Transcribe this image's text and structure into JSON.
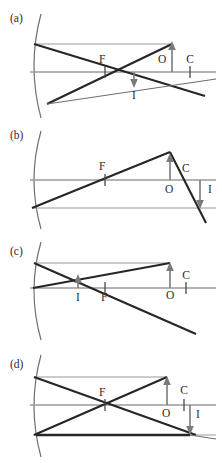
{
  "figure": {
    "type": "optics-ray-diagram-set",
    "width": 222,
    "height": 463,
    "background_color": "#ffffff",
    "ray_color": "#262626",
    "construction_line_color": "#8f8f8f",
    "mirror_color": "#6f6f6f",
    "arrow_color": "#7a7a7a",
    "label_color": "#2b2b2b"
  },
  "panels": [
    {
      "id": "a",
      "letter": "(a)",
      "letter_x": 10,
      "letter_y": 22,
      "axis_y": 72,
      "mirror": {
        "vertex_x": 30,
        "top_x": 40,
        "top_y": 14,
        "bottom_x": 40,
        "bottom_y": 118
      },
      "object": {
        "label": "O",
        "label_x": 158,
        "label_y": 63,
        "base_x": 172,
        "base_y": 72,
        "tip_y": 44,
        "direction": "up"
      },
      "image": {
        "label": "I",
        "label_x": 131,
        "label_y": 96,
        "base_x": 134,
        "base_y": 72,
        "tip_y": 86,
        "direction": "down"
      },
      "focal_point": {
        "label": "F",
        "label_x": 99,
        "label_y": 63,
        "x": 105
      },
      "center_point": {
        "label": "C",
        "label_x": 181,
        "label_y": 63,
        "x": 190
      },
      "notes": "Object beyond C; real inverted reduced image between F and C"
    },
    {
      "id": "b",
      "letter": "(b)",
      "letter_x": 10,
      "letter_y": 139,
      "axis_y": 180,
      "mirror": {
        "vertex_x": 30,
        "top_x": 40,
        "top_y": 131,
        "bottom_x": 40,
        "bottom_y": 228
      },
      "object": {
        "label": "O",
        "label_x": 165,
        "label_y": 192,
        "base_x": 170,
        "base_y": 180,
        "tip_y": 152,
        "direction": "up"
      },
      "image": {
        "label": "I",
        "label_x": 206,
        "label_y": 191,
        "base_x": 200,
        "base_y": 180,
        "tip_y": 208,
        "direction": "down"
      },
      "focal_point": {
        "label": "F",
        "label_x": 99,
        "label_y": 170,
        "x": 105
      },
      "center_point": {
        "label": "C",
        "label_x": 182,
        "label_y": 172,
        "x": 190
      },
      "notes": "Object between F and C; real inverted magnified image beyond C"
    },
    {
      "id": "c",
      "letter": "(c)",
      "letter_x": 10,
      "letter_y": 255,
      "axis_y": 288,
      "mirror": {
        "vertex_x": 30,
        "top_x": 40,
        "top_y": 243,
        "bottom_x": 40,
        "bottom_y": 338
      },
      "object": {
        "label": "O",
        "label_x": 166,
        "label_y": 299,
        "base_x": 170,
        "base_y": 288,
        "tip_y": 263,
        "direction": "up"
      },
      "image": {
        "label": "I",
        "label_x": 74,
        "label_y": 301,
        "base_x": 78,
        "base_y": 288,
        "tip_y": 276,
        "direction": "up"
      },
      "focal_point": {
        "label": "F",
        "label_x": 101,
        "label_y": 301,
        "x": 105
      },
      "center_point": {
        "label": "C",
        "label_x": 180,
        "label_y": 279,
        "x": 186
      },
      "notes": "Object far from mirror; real inverted reduced image near F"
    },
    {
      "id": "d",
      "letter": "(d)",
      "letter_x": 10,
      "letter_y": 363,
      "axis_y": 405,
      "mirror": {
        "vertex_x": 30,
        "top_x": 40,
        "top_y": 355,
        "bottom_x": 40,
        "bottom_y": 455
      },
      "object": {
        "label": "O",
        "label_x": 162,
        "label_y": 417,
        "base_x": 167,
        "base_y": 405,
        "tip_y": 377,
        "direction": "up"
      },
      "image": {
        "label": "I",
        "label_x": 196,
        "label_y": 418,
        "base_x": 190,
        "base_y": 405,
        "tip_y": 435,
        "direction": "down"
      },
      "focal_point": {
        "label": "F",
        "label_x": 99,
        "label_y": 396,
        "x": 105
      },
      "center_point": {
        "label": "C",
        "label_x": 178,
        "label_y": 394,
        "x": 184
      },
      "notes": "Object at C; real inverted same-size image at C"
    }
  ]
}
